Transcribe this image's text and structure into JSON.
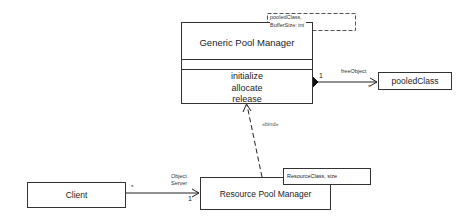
{
  "classes": {
    "generic_pool_manager": {
      "name": "Generic Pool Manager",
      "attributes": [],
      "operations": [
        "initialize",
        "allocate",
        "release"
      ],
      "template_params": [
        "pooledClass,",
        "BufferSize: int"
      ]
    },
    "pooled_class": {
      "name": "pooledClass"
    },
    "client": {
      "name": "Client"
    },
    "resource_pool_manager": {
      "name": "Resource Pool Manager",
      "binding_params": "ResourceClass, size"
    }
  },
  "relations": {
    "composition": {
      "role": "freeObject",
      "source_multiplicity": "1",
      "target_multiplicity": "*"
    },
    "bind": {
      "stereotype": "«bind»"
    },
    "association": {
      "role_line1": "Object",
      "role_line2": "Server",
      "source_multiplicity": "*",
      "target_multiplicity": "1"
    }
  }
}
